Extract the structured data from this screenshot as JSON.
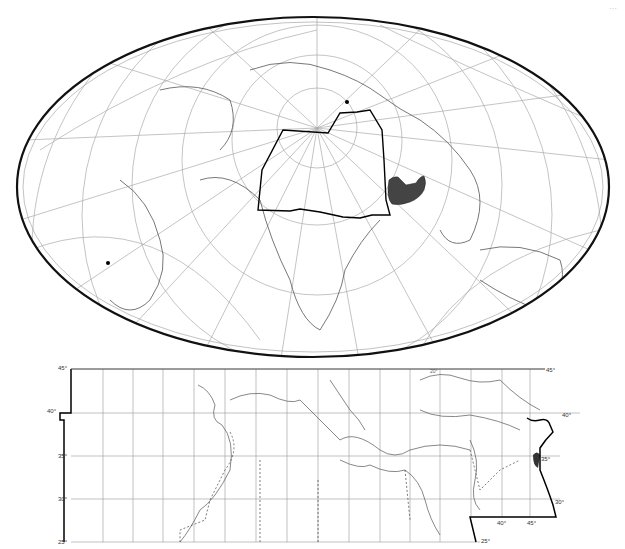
{
  "page": {
    "corner_text": "…",
    "title": ""
  },
  "world_map": {
    "projection": "oblique equal-area (ellipse)",
    "pole_marker": "north-pole-dot",
    "graticule_labels": [
      "40°",
      "10°",
      "60°",
      "80°",
      "60°",
      "40°",
      "20°",
      "0°"
    ],
    "region_outline": "study-area-boundary",
    "shaded_region": "Caspian / Mesopotamia highlighted area",
    "marker_dot": "south-america-dot"
  },
  "detail_map": {
    "lat_labels_left": [
      "45°",
      "40°",
      "35°",
      "30°",
      "25°"
    ],
    "lat_labels_right": [
      "45°",
      "40°",
      "35°",
      "30°",
      "25°"
    ],
    "lon_labels_bottom": [
      "40°",
      "45°"
    ],
    "top_label": "20°",
    "colors": {
      "graticule": "#999999",
      "coast": "#555555",
      "boundary": "#000000",
      "shade": "#444444"
    }
  }
}
